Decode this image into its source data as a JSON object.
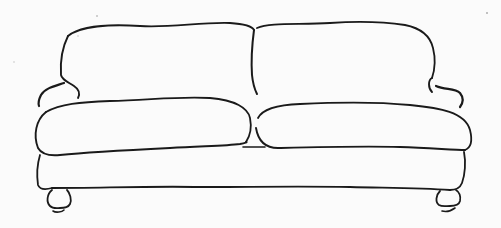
{
  "image": {
    "subject": "Pencil line sketch of a two-seat sofa",
    "style": "hand-drawn line art",
    "colors": {
      "background": "#fbfbfb",
      "ink": "#1a1a1a"
    },
    "parts": [
      "back-cushion-left",
      "back-cushion-right",
      "arm-left",
      "arm-right",
      "seat-cushion-left",
      "seat-cushion-right",
      "sofa-base",
      "leg-left",
      "leg-right"
    ]
  }
}
